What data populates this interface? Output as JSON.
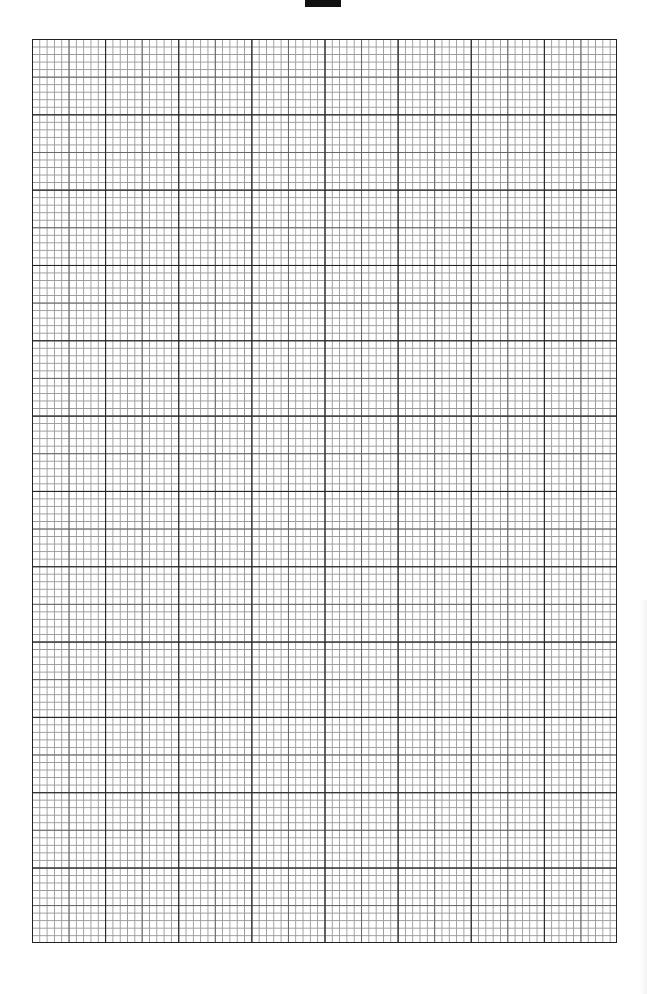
{
  "page": {
    "type": "graph-paper",
    "background_color": "#ffffff",
    "line_color_major": "#222222",
    "line_color_minor": "#9a9a9a"
  },
  "header": {
    "left_text": "",
    "right_text": "",
    "redaction_block": true
  },
  "grid": {
    "major_columns": 8,
    "major_rows": 12,
    "minor_subdivisions_per_major": 10,
    "emphasis_every_minor": 5
  }
}
